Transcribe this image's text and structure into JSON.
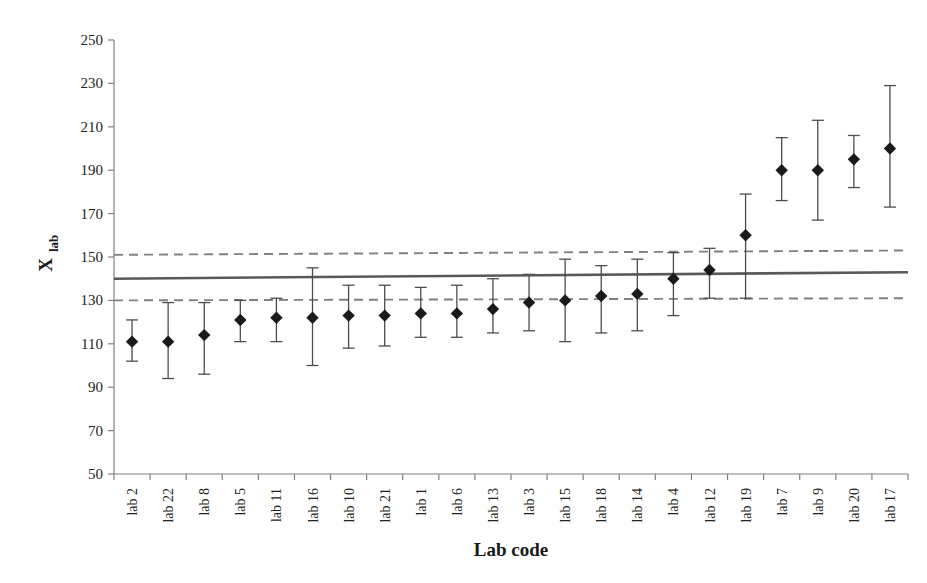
{
  "chart_data": {
    "type": "scatter",
    "title": "",
    "xlabel": "Lab code",
    "ylabel": "X",
    "ylabel_subscript": "lab",
    "ylim": [
      50,
      250
    ],
    "ytick_step": 20,
    "yticks": [
      50,
      70,
      90,
      110,
      130,
      150,
      170,
      190,
      210,
      230,
      250
    ],
    "ytick_labels": [
      "50",
      "70",
      "90",
      "110",
      "130",
      "150",
      "170",
      "190",
      "210",
      "230",
      "250"
    ],
    "grid": false,
    "legend": "none",
    "marker": "filled-diamond",
    "error_bar_style": "capped-vertical",
    "categories": [
      "lab 2",
      "lab 22",
      "lab 8",
      "lab 5",
      "lab 11",
      "lab 16",
      "lab 10",
      "lab 21",
      "lab 1",
      "lab 6",
      "lab 13",
      "lab 3",
      "lab 15",
      "lab 18",
      "lab 14",
      "lab 4",
      "lab 12",
      "lab 19",
      "lab 7",
      "lab 9",
      "lab 20",
      "lab 17"
    ],
    "values": [
      111,
      111,
      114,
      121,
      122,
      122,
      123,
      123,
      124,
      124,
      126,
      129,
      130,
      132,
      133,
      140,
      144,
      160,
      190,
      190,
      195,
      200
    ],
    "error_low": [
      102,
      94,
      96,
      111,
      111,
      100,
      108,
      109,
      113,
      113,
      115,
      116,
      111,
      115,
      116,
      123,
      131,
      131,
      176,
      167,
      182,
      173
    ],
    "error_high": [
      121,
      129,
      129,
      130,
      131,
      145,
      137,
      137,
      136,
      137,
      140,
      142,
      149,
      146,
      149,
      152,
      154,
      179,
      205,
      213,
      206,
      229
    ],
    "reference_lines": [
      {
        "name": "upper-limit",
        "style": "dashed",
        "y_start": 151,
        "y_end": 153,
        "color": "#808080"
      },
      {
        "name": "assigned-value",
        "style": "solid",
        "y_start": 140,
        "y_end": 143,
        "color": "#595959"
      },
      {
        "name": "lower-limit",
        "style": "dashed",
        "y_start": 130,
        "y_end": 131,
        "color": "#808080"
      }
    ]
  },
  "axis": {
    "y_title_main": "X",
    "y_title_sub": "lab",
    "x_title": "Lab code"
  }
}
